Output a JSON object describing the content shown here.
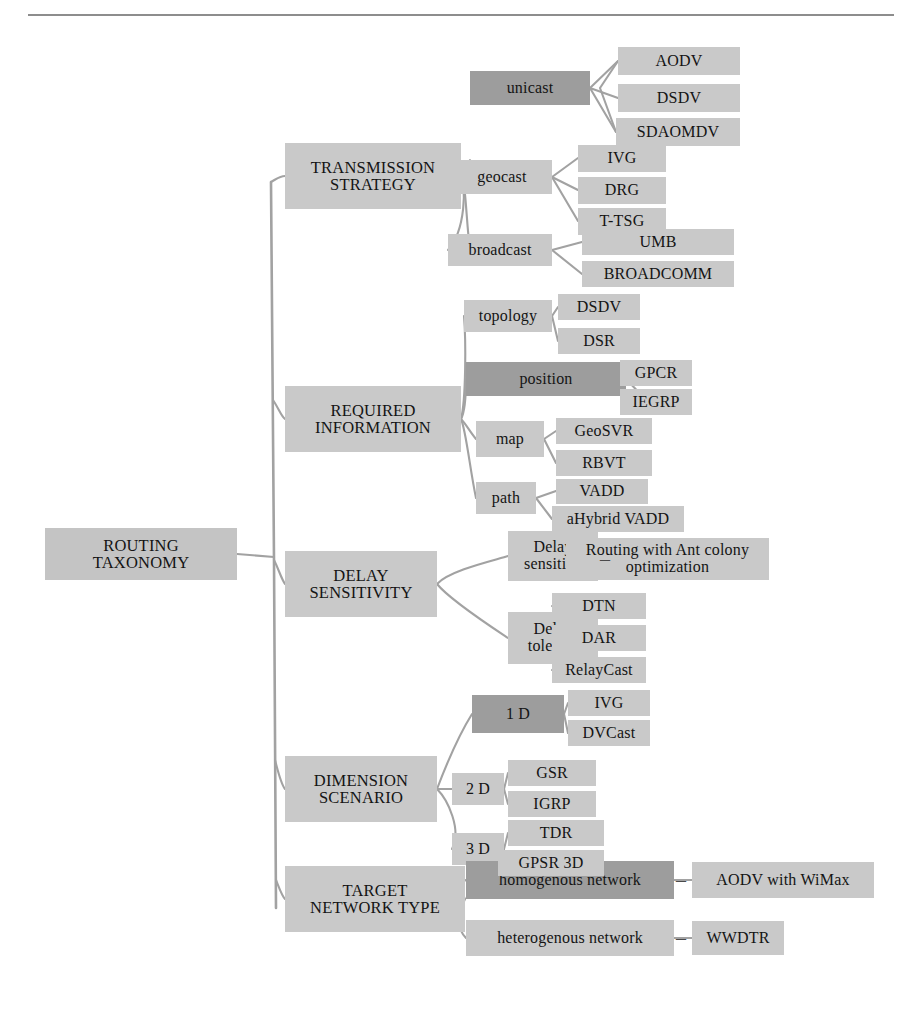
{
  "diagram": {
    "title": "ROUTING TAXONOMY",
    "type": "taxonomy-tree",
    "colors": {
      "light_box": "#c9c9c9",
      "dark_box": "#9d9d9d",
      "root_box": "#c4c4c4",
      "connector": "#9a9a9a",
      "text": "#141414",
      "rule": "#8d8d8d"
    },
    "root": {
      "label": "ROUTING\nTAXONOMY"
    },
    "categories": [
      {
        "label": "TRANSMISSION\nSTRATEGY",
        "children": [
          {
            "label": "unicast",
            "highlight": true,
            "leaves": [
              "AODV",
              "DSDV",
              "SDAOMDV"
            ]
          },
          {
            "label": "geocast",
            "highlight": false,
            "leaves": [
              "IVG",
              "DRG",
              "T-TSG"
            ]
          },
          {
            "label": "broadcast",
            "highlight": false,
            "leaves": [
              "UMB",
              "BROADCOMM"
            ]
          }
        ]
      },
      {
        "label": "REQUIRED\nINFORMATION",
        "children": [
          {
            "label": "topology",
            "highlight": false,
            "leaves": [
              "DSDV",
              "DSR"
            ]
          },
          {
            "label": "position",
            "highlight": true,
            "leaves": [
              "GPCR",
              "IEGRP"
            ]
          },
          {
            "label": "map",
            "highlight": false,
            "leaves": [
              "GeoSVR",
              "RBVT"
            ]
          },
          {
            "label": "path",
            "highlight": false,
            "leaves": [
              "VADD",
              "aHybrid VADD"
            ]
          }
        ]
      },
      {
        "label": "DELAY\nSENSITIVITY",
        "children": [
          {
            "label": "Delay\nsensitive",
            "highlight": false,
            "leaves": [
              "Routing with Ant colony\noptimization"
            ]
          },
          {
            "label": "Delay\ntolerent",
            "highlight": false,
            "leaves": [
              "DTN",
              "DAR",
              "RelayCast"
            ]
          }
        ]
      },
      {
        "label": "DIMENSION\nSCENARIO",
        "children": [
          {
            "label": "1 D",
            "highlight": true,
            "leaves": [
              "IVG",
              "DVCast"
            ]
          },
          {
            "label": "2 D",
            "highlight": false,
            "leaves": [
              "GSR",
              "IGRP"
            ]
          },
          {
            "label": "3 D",
            "highlight": false,
            "leaves": [
              "TDR",
              "GPSR 3D"
            ]
          }
        ]
      },
      {
        "label": "TARGET\nNETWORK TYPE",
        "children": [
          {
            "label": "homogenous network",
            "highlight": true,
            "leaves": [
              "AODV with WiMax"
            ]
          },
          {
            "label": "heterogenous network",
            "highlight": false,
            "leaves": [
              "WWDTR"
            ]
          }
        ]
      }
    ],
    "nodes": {
      "root": {
        "t": "root.0",
        "x": 45,
        "y": 528,
        "w": 192,
        "h": 52
      },
      "cat0": {
        "t": "cat.0",
        "x": 285,
        "y": 143,
        "w": 176,
        "h": 66
      },
      "cat1": {
        "t": "cat.1",
        "x": 285,
        "y": 386,
        "w": 176,
        "h": 66
      },
      "cat2": {
        "t": "cat.2",
        "x": 285,
        "y": 551,
        "w": 152,
        "h": 66
      },
      "cat3": {
        "t": "cat.3",
        "x": 285,
        "y": 756,
        "w": 152,
        "h": 66
      },
      "cat4": {
        "t": "cat.4",
        "x": 285,
        "y": 866,
        "w": 180,
        "h": 66
      },
      "m0_0": {
        "t": "mid",
        "x": 470,
        "y": 71,
        "w": 120,
        "h": 34
      },
      "m0_1": {
        "t": "mid",
        "x": 452,
        "y": 160,
        "w": 100,
        "h": 34
      },
      "m0_2": {
        "t": "mid",
        "x": 448,
        "y": 234,
        "w": 104,
        "h": 32
      },
      "m1_0": {
        "t": "mid",
        "x": 464,
        "y": 300,
        "w": 88,
        "h": 32
      },
      "m1_1": {
        "t": "mid",
        "x": 466,
        "y": 362,
        "w": 160,
        "h": 34
      },
      "m1_2": {
        "t": "mid",
        "x": 476,
        "y": 421,
        "w": 68,
        "h": 36
      },
      "m1_3": {
        "t": "mid",
        "x": 476,
        "y": 482,
        "w": 60,
        "h": 32
      },
      "m2_0": {
        "t": "mid",
        "x": 508,
        "y": 531,
        "w": 90,
        "h": 50
      },
      "m2_1": {
        "t": "mid",
        "x": 508,
        "y": 612,
        "w": 90,
        "h": 52
      },
      "m3_0": {
        "t": "mid",
        "x": 472,
        "y": 695,
        "w": 92,
        "h": 38
      },
      "m3_1": {
        "t": "mid",
        "x": 452,
        "y": 773,
        "w": 52,
        "h": 32
      },
      "m3_2": {
        "t": "mid",
        "x": 452,
        "y": 833,
        "w": 52,
        "h": 32
      },
      "m4_0": {
        "t": "mid",
        "x": 466,
        "y": 861,
        "w": 208,
        "h": 38
      },
      "m4_1": {
        "t": "mid",
        "x": 466,
        "y": 920,
        "w": 208,
        "h": 36
      },
      "l0_0_0": {
        "t": "leaf",
        "x": 618,
        "y": 47,
        "w": 122,
        "h": 28
      },
      "l0_0_1": {
        "t": "leaf",
        "x": 618,
        "y": 84,
        "w": 122,
        "h": 28
      },
      "l0_0_2": {
        "t": "leaf",
        "x": 616,
        "y": 118,
        "w": 124,
        "h": 28
      },
      "l0_1_0": {
        "t": "leaf",
        "x": 578,
        "y": 145,
        "w": 88,
        "h": 27
      },
      "l0_1_1": {
        "t": "leaf",
        "x": 578,
        "y": 177,
        "w": 88,
        "h": 27
      },
      "l0_1_2": {
        "t": "leaf",
        "x": 578,
        "y": 208,
        "w": 88,
        "h": 27
      },
      "l0_2_0": {
        "t": "leaf",
        "x": 582,
        "y": 229,
        "w": 152,
        "h": 26
      },
      "l0_2_1": {
        "t": "leaf",
        "x": 582,
        "y": 261,
        "w": 152,
        "h": 26
      },
      "l1_0_0": {
        "t": "leaf",
        "x": 558,
        "y": 294,
        "w": 82,
        "h": 26
      },
      "l1_0_1": {
        "t": "leaf",
        "x": 558,
        "y": 328,
        "w": 82,
        "h": 26
      },
      "l1_1_0": {
        "t": "leaf",
        "x": 620,
        "y": 360,
        "w": 72,
        "h": 26
      },
      "l1_1_1": {
        "t": "leaf",
        "x": 620,
        "y": 389,
        "w": 72,
        "h": 26
      },
      "l1_2_0": {
        "t": "leaf",
        "x": 556,
        "y": 418,
        "w": 96,
        "h": 26
      },
      "l1_2_1": {
        "t": "leaf",
        "x": 556,
        "y": 450,
        "w": 96,
        "h": 26
      },
      "l1_3_0": {
        "t": "leaf",
        "x": 556,
        "y": 479,
        "w": 92,
        "h": 25
      },
      "l1_3_1": {
        "t": "leaf",
        "x": 552,
        "y": 506,
        "w": 132,
        "h": 26
      },
      "l2_0_0": {
        "t": "leaf",
        "x": 566,
        "y": 538,
        "w": 203,
        "h": 42
      },
      "l2_1_0": {
        "t": "leaf",
        "x": 552,
        "y": 593,
        "w": 94,
        "h": 26
      },
      "l2_1_1": {
        "t": "leaf",
        "x": 552,
        "y": 625,
        "w": 94,
        "h": 26
      },
      "l2_1_2": {
        "t": "leaf",
        "x": 552,
        "y": 657,
        "w": 94,
        "h": 26
      },
      "l3_0_0": {
        "t": "leaf",
        "x": 568,
        "y": 690,
        "w": 82,
        "h": 26
      },
      "l3_0_1": {
        "t": "leaf",
        "x": 568,
        "y": 720,
        "w": 82,
        "h": 26
      },
      "l3_1_0": {
        "t": "leaf",
        "x": 508,
        "y": 760,
        "w": 88,
        "h": 26
      },
      "l3_1_1": {
        "t": "leaf",
        "x": 508,
        "y": 791,
        "w": 88,
        "h": 26
      },
      "l3_2_0": {
        "t": "leaf",
        "x": 508,
        "y": 820,
        "w": 96,
        "h": 26
      },
      "l3_2_1": {
        "t": "leaf",
        "x": 498,
        "y": 850,
        "w": 106,
        "h": 26
      },
      "l4_0_0": {
        "t": "leaf",
        "x": 692,
        "y": 862,
        "w": 182,
        "h": 36
      },
      "l4_1_0": {
        "t": "leaf",
        "x": 692,
        "y": 921,
        "w": 92,
        "h": 34
      }
    }
  }
}
